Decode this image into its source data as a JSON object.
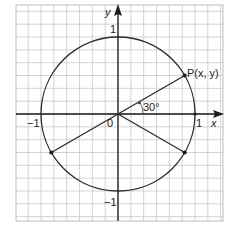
{
  "diagram": {
    "type": "unit-circle",
    "colors": {
      "grid": "#c8c8c8",
      "border": "#bdbdbd",
      "axes": "#1a1a1a",
      "circle": "#2a2a2a",
      "text": "#222222"
    },
    "axes": {
      "x_label": "x",
      "y_label": "y",
      "origin_label": "0",
      "x_ticks": [
        "−1",
        "1"
      ],
      "y_ticks": [
        "1",
        "−1"
      ]
    },
    "circle": {
      "radius": 1,
      "center": [
        0,
        0
      ]
    },
    "points": [
      {
        "name": "P",
        "label": "P(x, y)",
        "angle_deg": 30
      },
      {
        "name": "lower-left",
        "label": "",
        "angle_deg": 210
      },
      {
        "name": "lower-right",
        "label": "",
        "angle_deg": 330
      }
    ],
    "angle_label": "30°"
  }
}
